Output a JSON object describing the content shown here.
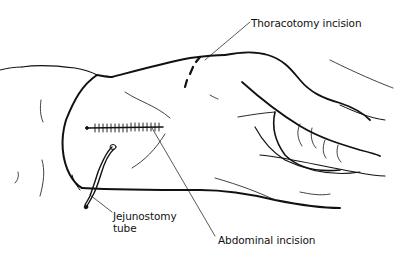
{
  "figure": {
    "labels": {
      "thoracotomy": "Thoracotomy incision",
      "jejunostomy_line1": "Jejunostomy",
      "jejunostomy_line2": "tube",
      "abdominal": "Abdominal incision"
    },
    "colors": {
      "background": "#ffffff",
      "ink": "#111111"
    }
  }
}
